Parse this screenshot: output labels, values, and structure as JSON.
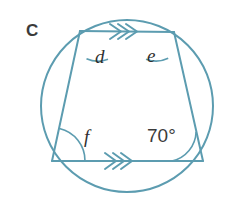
{
  "figure": {
    "part_label": "C",
    "colors": {
      "stroke": "#5c9cb0",
      "text": "#3b3b3b",
      "label_text": "#2f2f2f",
      "background": "#ffffff"
    },
    "circle": {
      "cx": 127,
      "cy": 106,
      "r": 86
    },
    "quadrilateral": {
      "vertices": [
        {
          "name": "top-left",
          "x": 80,
          "y": 31
        },
        {
          "name": "top-right",
          "x": 174,
          "y": 32
        },
        {
          "name": "bottom-right",
          "x": 203,
          "y": 161
        },
        {
          "name": "bottom-left",
          "x": 52,
          "y": 161
        }
      ]
    },
    "parallel_marks": {
      "count": 3,
      "direction": "right",
      "sides": [
        "top",
        "bottom"
      ]
    },
    "angles": [
      {
        "id": "d",
        "label": "d",
        "vertex": "top-left",
        "known": false
      },
      {
        "id": "e",
        "label": "e",
        "vertex": "top-right",
        "known": false
      },
      {
        "id": "f",
        "label": "f",
        "vertex": "bottom-left",
        "known": false
      },
      {
        "id": "known",
        "label": "70°",
        "vertex": "bottom-right",
        "known": true
      }
    ]
  }
}
